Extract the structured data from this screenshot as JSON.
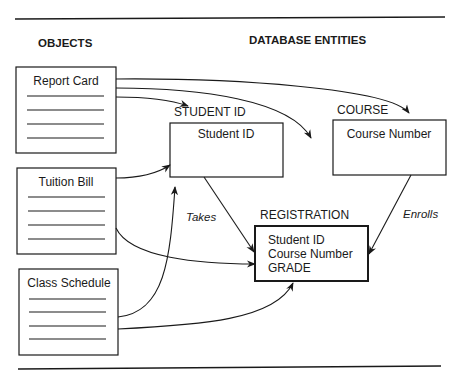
{
  "headers": {
    "objects": "OBJECTS",
    "database_entities": "DATABASE ENTITIES"
  },
  "objects": [
    {
      "id": "report-card",
      "title": "Report Card",
      "line_count": 4
    },
    {
      "id": "tuition-bill",
      "title": "Tuition Bill",
      "line_count": 4
    },
    {
      "id": "class-schedule",
      "title": "Class Schedule",
      "line_count": 4
    }
  ],
  "entities": {
    "student_id": {
      "label": "STUDENT ID",
      "fields": [
        "Student ID"
      ]
    },
    "course": {
      "label": "COURSE",
      "fields": [
        "Course Number"
      ]
    },
    "registration": {
      "label": "REGISTRATION",
      "fields": [
        "Student ID",
        "Course Number",
        "GRADE"
      ]
    }
  },
  "relationships": {
    "takes": "Takes",
    "enrolls": "Enrolls"
  },
  "connections": [
    {
      "from": "report-card",
      "to": "student_id"
    },
    {
      "from": "report-card",
      "to": "registration"
    },
    {
      "from": "report-card",
      "to": "course"
    },
    {
      "from": "tuition-bill",
      "to": "student_id"
    },
    {
      "from": "tuition-bill",
      "to": "registration"
    },
    {
      "from": "class-schedule",
      "to": "student_id"
    },
    {
      "from": "class-schedule",
      "to": "registration"
    },
    {
      "from": "student_id",
      "to": "registration",
      "label": "Takes"
    },
    {
      "from": "course",
      "to": "registration",
      "label": "Enrolls"
    }
  ]
}
